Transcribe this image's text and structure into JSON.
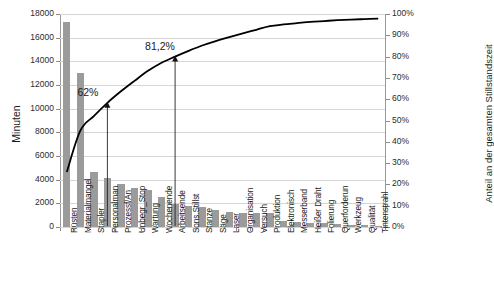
{
  "chart_data": {
    "type": "bar",
    "title": "",
    "xlabel": "",
    "ylabel": "Minuten",
    "y2label": "Anteil an der gesamten Stillstandszeit",
    "ylim": [
      0,
      18000
    ],
    "y2lim": [
      0,
      100
    ],
    "grid": true,
    "legend": "none",
    "categories": [
      "Rüsten",
      "Materialmangel",
      "Stapler",
      "Personalman",
      "Prozessf/An",
      "Unbegr_Stop",
      "Wartung",
      "Wochenende",
      "Arbeitsende",
      "Sons.Stillst",
      "Stanze",
      "Säge",
      "Laser",
      "Organisation",
      "Versuch",
      "Produktion",
      "Elektronisch",
      "Messerband",
      "Heißer Draht",
      "Folierung",
      "Querforderun",
      "Werkzeug",
      "Qualität",
      "Tintenstrahl"
    ],
    "series": [
      {
        "name": "Minuten",
        "type": "bar",
        "values": [
          17350,
          13000,
          4650,
          4150,
          3600,
          3300,
          3150,
          2550,
          1950,
          1800,
          1650,
          1400,
          1250,
          1200,
          1150,
          1150,
          500,
          450,
          380,
          300,
          250,
          200,
          150,
          100
        ]
      },
      {
        "name": "Kumuliert",
        "type": "line",
        "axis": "secondary",
        "values": [
          25.8,
          45.2,
          52.1,
          58.3,
          63.7,
          68.6,
          73.3,
          77.1,
          80.0,
          82.7,
          85.2,
          87.3,
          89.1,
          90.9,
          92.6,
          94.3,
          95.1,
          95.7,
          96.3,
          96.7,
          97.1,
          97.4,
          97.6,
          97.8
        ]
      }
    ],
    "yticks": [
      "0",
      "2000",
      "4000",
      "6000",
      "8000",
      "10000",
      "12000",
      "14000",
      "16000",
      "18000"
    ],
    "y2ticks": [
      "0%",
      "10%",
      "20%",
      "30%",
      "40%",
      "50%",
      "60%",
      "70%",
      "80%",
      "90%",
      "100%"
    ],
    "annotations": [
      {
        "label": "62%",
        "target_category": "Personalman",
        "target_index": 3
      },
      {
        "label": "81,2%",
        "target_category": "Wochenende",
        "target_index": 8
      }
    ],
    "colors": {
      "bar": "#9b9b9b",
      "line": "#000000",
      "grid": "#d6d6d6",
      "axis": "#8c8c8c",
      "text": "#1a1a1a"
    }
  }
}
